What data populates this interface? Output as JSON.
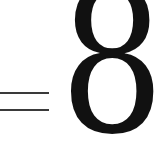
{
  "expression": {
    "operator": "=",
    "value": "8"
  },
  "colors": {
    "ink": "#111111",
    "background": "#ffffff"
  }
}
